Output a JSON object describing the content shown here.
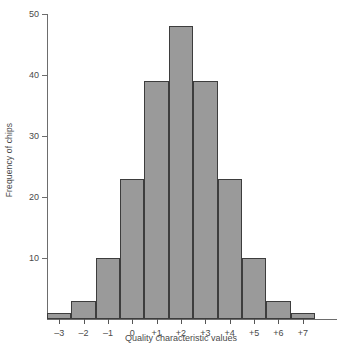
{
  "chart_data": {
    "type": "bar",
    "title": "",
    "subtitle": "",
    "xlabel": "Quality characteristic values",
    "ylabel": "Frequency of chips",
    "categories": [
      "-3",
      "-2",
      "-1",
      "0",
      "+1",
      "+2",
      "+3",
      "+4",
      "+5",
      "+6",
      "+7"
    ],
    "values": [
      1,
      3,
      10,
      23,
      39,
      48,
      39,
      23,
      10,
      3,
      1
    ],
    "xlim": [
      -3.5,
      7.5
    ],
    "ylim": [
      0,
      50
    ],
    "yticks": [
      10,
      20,
      30,
      40,
      50
    ],
    "ytick_labels": [
      "10",
      "20",
      "30",
      "40",
      "50"
    ],
    "grid": false,
    "legend": null,
    "bar_color": "#9a9a9a",
    "bar_edge_color": "#3d3d3d",
    "axis_color": "#6d6d6d",
    "text_color": "#4a4a4a",
    "background": "#ffffff"
  }
}
